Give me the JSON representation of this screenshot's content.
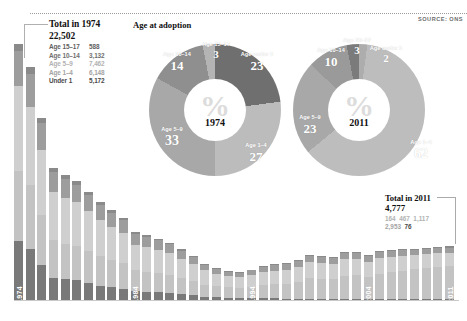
{
  "source_note": "SOURCE: ONS",
  "left_callout": {
    "title": "Total in 1974",
    "total": "22,502",
    "rows": [
      {
        "label": "Age 15–17",
        "value": "588",
        "cls": "c-1517"
      },
      {
        "label": "Age 10–14",
        "value": "3,132",
        "cls": "c-1014"
      },
      {
        "label": "Age 5–9",
        "value": "7,462",
        "cls": "c-59"
      },
      {
        "label": "Age 1–4",
        "value": "6,148",
        "cls": "c-14"
      },
      {
        "label": "Under 1",
        "value": "5,172",
        "cls": "c-u1"
      }
    ]
  },
  "right_callout": {
    "title": "Total in 2011",
    "total": "4,777",
    "numbers_row1": [
      {
        "value": "164",
        "cls": "c-59"
      },
      {
        "value": "467",
        "cls": "c-59"
      },
      {
        "value": "1,117",
        "cls": "c-59"
      }
    ],
    "numbers_row2": [
      {
        "value": "2,953",
        "cls": "c-14"
      },
      {
        "value": "76",
        "cls": "c-u1"
      }
    ]
  },
  "donut_title": "Age at adoption",
  "chart_data": [
    {
      "type": "pie",
      "title": "Age at adoption",
      "center_label": "%",
      "year": "1974",
      "unit": "percent",
      "categories": [
        "Age under 1",
        "Age 1–4",
        "Age 5–9",
        "Age 10–14",
        "Age 15–17"
      ],
      "values": [
        23,
        27,
        33,
        14,
        3
      ],
      "colors": [
        "#6f6f6f",
        "#bcbcbc",
        "#a8a8a8",
        "#8f8f8f",
        "#b4b4b4"
      ],
      "legend": "labels on slices"
    },
    {
      "type": "pie",
      "title": "Age at adoption",
      "center_label": "%",
      "year": "2011",
      "unit": "percent",
      "categories": [
        "Age under 1",
        "Age 1–4",
        "Age 5–9",
        "Age 10–14",
        "Age 15–17"
      ],
      "values": [
        2,
        62,
        23,
        10,
        3
      ],
      "colors": [
        "#adadad",
        "#bdbdbd",
        "#a8a8a8",
        "#9a9a9a",
        "#7b7b7b"
      ],
      "legend": "labels on slices"
    },
    {
      "type": "bar",
      "subtype": "stacked",
      "title": "",
      "xlabel": "",
      "ylabel": "",
      "ylim": [
        0,
        22502
      ],
      "grid": false,
      "tick_labels": [
        "1974",
        "1984",
        "1994",
        "2004",
        "2011"
      ],
      "categories": [
        "1974",
        "1975",
        "1976",
        "1977",
        "1978",
        "1979",
        "1980",
        "1981",
        "1982",
        "1983",
        "1984",
        "1985",
        "1986",
        "1987",
        "1988",
        "1989",
        "1990",
        "1991",
        "1992",
        "1993",
        "1994",
        "1995",
        "1996",
        "1997",
        "1998",
        "1999",
        "2000",
        "2001",
        "2002",
        "2003",
        "2004",
        "2005",
        "2006",
        "2007",
        "2008",
        "2009",
        "2010",
        "2011"
      ],
      "series": [
        {
          "name": "Under 1",
          "color": "#797979",
          "values": [
            5172,
            4500,
            3050,
            1950,
            1800,
            1750,
            1500,
            1250,
            1100,
            980,
            820,
            700,
            660,
            620,
            520,
            420,
            300,
            240,
            200,
            170,
            150,
            140,
            130,
            120,
            115,
            110,
            115,
            120,
            110,
            105,
            100,
            95,
            90,
            88,
            85,
            82,
            80,
            76
          ]
        },
        {
          "name": "Age 1–4",
          "color": "#c3c3c3",
          "values": [
            6148,
            5600,
            4400,
            3300,
            3150,
            3000,
            2850,
            2600,
            2400,
            2250,
            1850,
            1800,
            1700,
            1600,
            1400,
            1250,
            1050,
            980,
            900,
            880,
            1000,
            1150,
            1250,
            1300,
            1500,
            1800,
            1750,
            1700,
            2000,
            2050,
            1900,
            2200,
            2350,
            2500,
            2600,
            2750,
            2850,
            2953
          ]
        },
        {
          "name": "Age 5–9",
          "color": "#cfcfcf",
          "values": [
            7462,
            6900,
            5700,
            4250,
            4050,
            3850,
            3500,
            3200,
            2950,
            2700,
            2200,
            2150,
            2050,
            1900,
            1700,
            1500,
            1250,
            1100,
            980,
            950,
            1050,
            1150,
            1200,
            1250,
            1300,
            1400,
            1380,
            1350,
            1450,
            1450,
            1350,
            1400,
            1350,
            1300,
            1250,
            1200,
            1180,
            1117
          ]
        },
        {
          "name": "Age 10–14",
          "color": "#9d9d9d",
          "values": [
            3132,
            2900,
            2400,
            1750,
            1650,
            1550,
            1400,
            1300,
            1200,
            1100,
            900,
            880,
            830,
            780,
            700,
            600,
            500,
            440,
            400,
            380,
            400,
            440,
            460,
            470,
            500,
            520,
            510,
            500,
            530,
            530,
            500,
            520,
            510,
            500,
            490,
            480,
            475,
            467
          ]
        },
        {
          "name": "Age 15–17",
          "color": "#8a8a8a",
          "values": [
            588,
            540,
            450,
            330,
            310,
            290,
            265,
            245,
            225,
            205,
            170,
            165,
            155,
            145,
            130,
            112,
            95,
            82,
            75,
            70,
            75,
            82,
            86,
            88,
            94,
            98,
            96,
            94,
            100,
            100,
            94,
            98,
            96,
            94,
            92,
            90,
            88,
            164
          ]
        }
      ]
    }
  ],
  "bar_geometry": {
    "left": 14,
    "top": 44,
    "width": 445,
    "height": 256,
    "pitch": 11.65,
    "bar_width": 9,
    "max_total": 22502,
    "tick_years": [
      "1974",
      "1984",
      "1994",
      "2004",
      "2011"
    ],
    "tick_indexes": [
      0,
      10,
      20,
      30,
      37
    ]
  },
  "donut_geometry": [
    {
      "cx": 215,
      "cy": 110,
      "r": 66,
      "hole": 31,
      "year_index": 0
    },
    {
      "cx": 359,
      "cy": 110,
      "r": 66,
      "hole": 31,
      "year_index": 1
    }
  ],
  "slice_labels_1974": [
    {
      "name": "Age 15–17",
      "value": "3",
      "x": 216,
      "y": 42,
      "size": 11
    },
    {
      "name": "Age under 1",
      "value": "23",
      "x": 257,
      "y": 52,
      "size": 13
    },
    {
      "name": "Age 1–4",
      "value": "27",
      "x": 256,
      "y": 143,
      "size": 13
    },
    {
      "name": "Age 5–9",
      "value": "33",
      "x": 172,
      "y": 127,
      "size": 14
    },
    {
      "name": "Age 10–14",
      "value": "14",
      "x": 177,
      "y": 52,
      "size": 13
    }
  ],
  "slice_labels_2011": [
    {
      "name": "Age 15–17",
      "value": "3",
      "x": 357,
      "y": 38,
      "size": 11
    },
    {
      "name": "Age under 1",
      "value": "2",
      "x": 386,
      "y": 46,
      "size": 11
    },
    {
      "name": "Age 1–4",
      "value": "62",
      "x": 421,
      "y": 140,
      "size": 14
    },
    {
      "name": "Age 5–9",
      "value": "23",
      "x": 310,
      "y": 115,
      "size": 13
    },
    {
      "name": "Age 10–14",
      "value": "10",
      "x": 331,
      "y": 48,
      "size": 13
    }
  ]
}
